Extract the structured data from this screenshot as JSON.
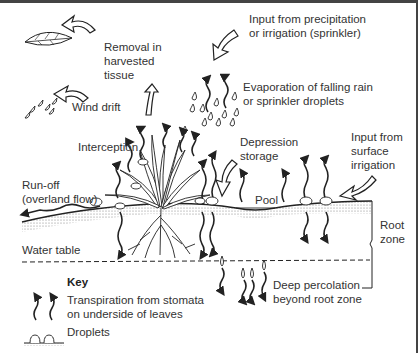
{
  "diagram": {
    "labels": {
      "removal": "Removal in\nharvested\ntissue",
      "input_precip": "Input from precipitation\nor irrigation (sprinkler)",
      "wind_drift": "Wind drift",
      "evaporation": "Evaporation of falling rain\nor sprinkler droplets",
      "interception": "Interception",
      "depression": "Depression\nstorage",
      "input_surface": "Input from\nsurface\nirrigation",
      "runoff": "Run-off\n(overland flow)",
      "pool": "Pool",
      "root_zone": "Root\nzone",
      "water_table": "Water table",
      "deep_percolation": "Deep percolation\nbeyond root zone"
    },
    "key": {
      "title": "Key",
      "transpiration": "Transpiration from stomata\non underside of leaves",
      "droplets": "Droplets"
    },
    "colors": {
      "ink": "#222222",
      "text": "#333333",
      "frame": "#444444"
    }
  }
}
